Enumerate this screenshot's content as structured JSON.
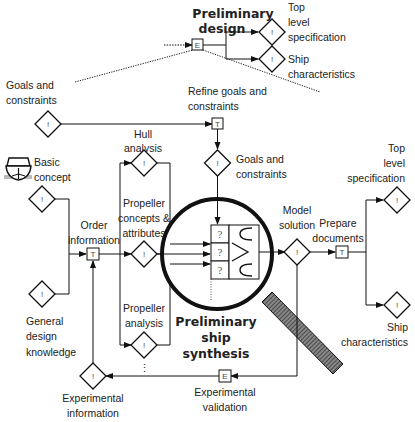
{
  "inset": {
    "title_line1": "Preliminary",
    "title_line2": "design",
    "outputs": [
      {
        "lines": [
          "Top",
          "level",
          "specification"
        ]
      },
      {
        "lines": [
          "Ship",
          "characteristics"
        ]
      }
    ],
    "node_glyph": "E"
  },
  "labels": {
    "goals_constraints_top": [
      "Goals and",
      "constraints"
    ],
    "refine_goals": [
      "Refine goals and",
      "constraints"
    ],
    "hull_analysis": [
      "Hull",
      "analysis"
    ],
    "basic_concept": [
      "Basic",
      "concept"
    ],
    "goals_constraints_mid": [
      "Goals and",
      "constraints"
    ],
    "order_information": [
      "Order",
      "information"
    ],
    "propeller_concepts": [
      "Propeller",
      "concepts &",
      "attributes"
    ],
    "model_solution": [
      "Model",
      "solution"
    ],
    "prepare_documents": [
      "Prepare",
      "documents"
    ],
    "top_level_spec": [
      "Top",
      "level",
      "specification"
    ],
    "general_design": [
      "General",
      "design",
      "knowledge"
    ],
    "propeller_analysis": [
      "Propeller",
      "analysis"
    ],
    "ship_characteristics": [
      "Ship",
      "characteristics"
    ],
    "experimental_information": [
      "Experimental",
      "information"
    ],
    "experimental_validation": [
      "Experimental",
      "validation"
    ],
    "synthesis": [
      "Preliminary",
      "ship",
      "synthesis"
    ],
    "ellipsis": "⋮"
  },
  "glyphs": {
    "info": "!",
    "task": "T",
    "experiment": "E",
    "question": "?"
  }
}
